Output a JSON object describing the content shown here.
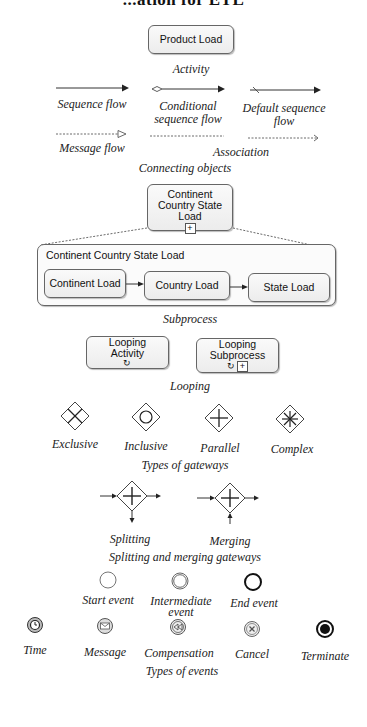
{
  "title": "...ation for ETL",
  "activity": {
    "box_label": "Product Load",
    "caption": "Activity"
  },
  "connecting_objects": {
    "items": [
      {
        "id": "sequence-flow",
        "label": "Sequence flow"
      },
      {
        "id": "conditional-sequence-flow",
        "label_line1": "Conditional",
        "label_line2": "sequence flow"
      },
      {
        "id": "default-sequence-flow",
        "label_line1": "Default sequence",
        "label_line2": "flow"
      },
      {
        "id": "message-flow",
        "label": "Message flow"
      },
      {
        "id": "association",
        "label": "Association"
      }
    ],
    "caption": "Connecting objects"
  },
  "subprocess": {
    "collapsed_line1": "Continent",
    "collapsed_line2": "Country State",
    "collapsed_line3": "Load",
    "collapsed_marker": "+",
    "expanded_title": "Continent Country State Load",
    "tasks": [
      "Continent Load",
      "Country Load",
      "State Load"
    ],
    "caption": "Subprocess"
  },
  "looping": {
    "activity_line1": "Looping",
    "activity_line2": "Activity",
    "subprocess_line1": "Looping",
    "subprocess_line2": "Subprocess",
    "loop_glyph": "↻",
    "marker": "+",
    "caption": "Looping"
  },
  "gateways": {
    "items": [
      {
        "id": "exclusive",
        "label": "Exclusive",
        "icon": "x-icon"
      },
      {
        "id": "inclusive",
        "label": "Inclusive",
        "icon": "circle-icon"
      },
      {
        "id": "parallel",
        "label": "Parallel",
        "icon": "plus-icon"
      },
      {
        "id": "complex",
        "label": "Complex",
        "icon": "asterisk-icon"
      }
    ],
    "caption": "Types of gateways"
  },
  "split_merge": {
    "splitting": "Splitting",
    "merging": "Merging",
    "caption": "Splitting and merging gateways"
  },
  "events_basic": {
    "start": "Start event",
    "intermediate_line1": "Intermediate",
    "intermediate_line2": "event",
    "end": "End event"
  },
  "events_types": {
    "items": [
      {
        "id": "time",
        "label": "Time",
        "icon": "clock-icon"
      },
      {
        "id": "message",
        "label": "Message",
        "icon": "envelope-icon"
      },
      {
        "id": "compensation",
        "label": "Compensation",
        "icon": "rewind-icon"
      },
      {
        "id": "cancel",
        "label": "Cancel",
        "icon": "x-circle-icon"
      },
      {
        "id": "terminate",
        "label": "Terminate",
        "icon": "filled-circle-icon"
      }
    ],
    "caption": "Types of events"
  }
}
